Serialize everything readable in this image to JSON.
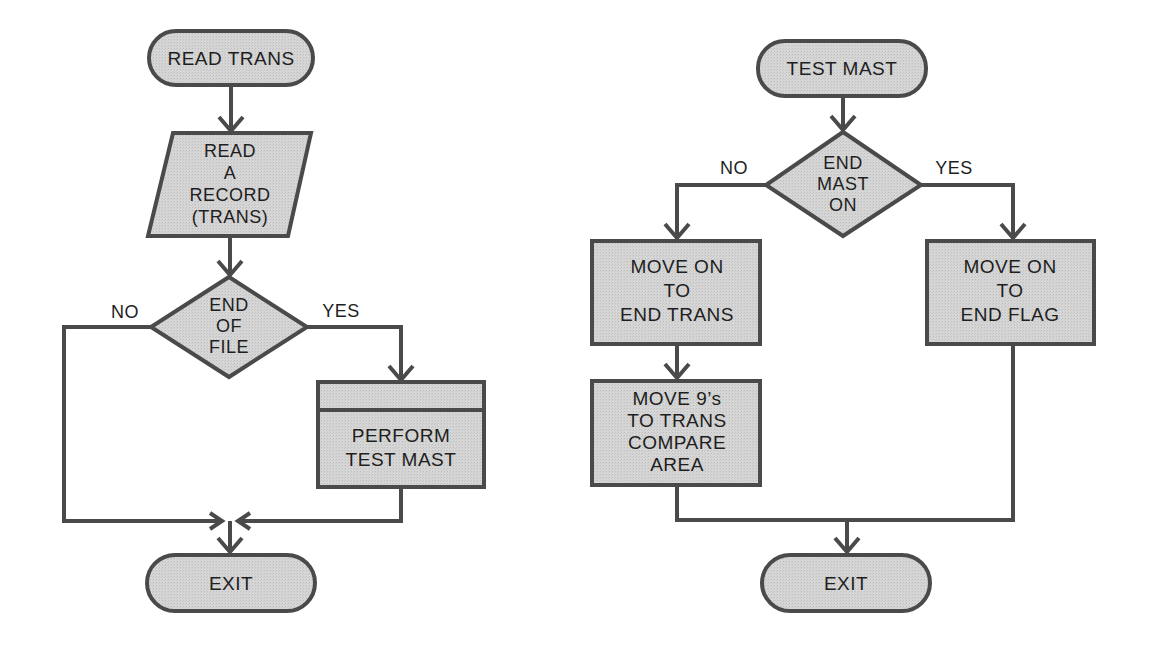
{
  "colors": {
    "stroke": "#4a4a4a",
    "fill": "#d4d4d4",
    "text": "#1e1e1e",
    "background": "#ffffff"
  },
  "left_chart": {
    "start": {
      "shape": "terminal",
      "label": "READ TRANS"
    },
    "input": {
      "shape": "parallelogram",
      "lines": [
        "READ",
        "A",
        "RECORD",
        "(TRANS)"
      ]
    },
    "decision": {
      "shape": "diamond",
      "lines": [
        "END",
        "OF",
        "FILE"
      ],
      "no_label": "NO",
      "yes_label": "YES"
    },
    "predefined": {
      "shape": "predefined-process",
      "lines": [
        "PERFORM",
        "TEST MAST"
      ]
    },
    "end": {
      "shape": "terminal",
      "label": "EXIT"
    }
  },
  "right_chart": {
    "start": {
      "shape": "terminal",
      "label": "TEST MAST"
    },
    "decision": {
      "shape": "diamond",
      "lines": [
        "END",
        "MAST",
        "ON"
      ],
      "no_label": "NO",
      "yes_label": "YES"
    },
    "process_no_1": {
      "shape": "process",
      "lines": [
        "MOVE ON",
        "TO",
        "END TRANS"
      ]
    },
    "process_no_2": {
      "shape": "process",
      "lines": [
        "MOVE 9’s",
        "TO TRANS",
        "COMPARE",
        "AREA"
      ]
    },
    "process_yes": {
      "shape": "process",
      "lines": [
        "MOVE ON",
        "TO",
        "END FLAG"
      ]
    },
    "end": {
      "shape": "terminal",
      "label": "EXIT"
    }
  }
}
